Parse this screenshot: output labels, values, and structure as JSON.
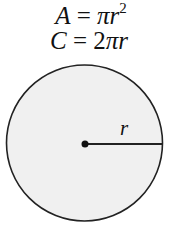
{
  "formulas": {
    "area": {
      "lhs": "A",
      "eq": "=",
      "pi": "π",
      "var": "r",
      "exp": "2"
    },
    "circumference": {
      "lhs": "C",
      "eq": "=",
      "coef": "2",
      "pi": "π",
      "var": "r"
    }
  },
  "diagram": {
    "radius_label": "r",
    "fill_color": "#f0f0f0",
    "stroke_color": "#222222"
  }
}
